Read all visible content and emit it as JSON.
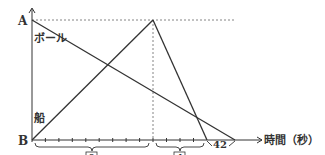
{
  "diagram": {
    "type": "distance-time graph",
    "y_axis": {
      "top_label": "A",
      "bottom_label": "B"
    },
    "x_axis": {
      "label": "時間（秒）"
    },
    "lines": {
      "ball": {
        "label": "ボール",
        "from": "A at t=0",
        "to": "B at t=42"
      },
      "ship": {
        "label": "船",
        "from": "B at t=0",
        "peak": "A",
        "to": "B"
      }
    },
    "braces": [
      {
        "label": "9",
        "boxed": true
      },
      {
        "label": "4",
        "boxed": true
      },
      {
        "label": "42",
        "boxed": false
      }
    ],
    "colors": {
      "line": "#333333",
      "dotted": "#666666",
      "background": "#ffffff"
    }
  }
}
